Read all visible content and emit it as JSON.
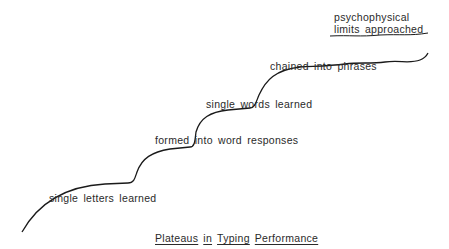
{
  "diagram": {
    "title_words": [
      "Plateaus",
      "in",
      "Typing",
      "Performance"
    ],
    "stages": [
      {
        "label": "single letters learned"
      },
      {
        "label": "formed into word responses"
      },
      {
        "label": "single words learned"
      },
      {
        "label": "chained into phrases"
      },
      {
        "label_line1": "psychophysical",
        "label_line2": "limits approached"
      }
    ],
    "colors": {
      "curve": "#1a1a1a",
      "text": "#2a2a2a",
      "background": "#ffffff"
    }
  }
}
